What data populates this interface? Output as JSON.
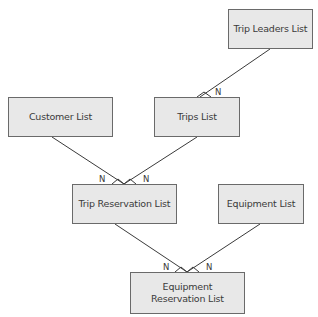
{
  "diagram": {
    "type": "entity-relationship",
    "nodes": [
      {
        "id": "trip_leaders",
        "label": "Trip Leaders List",
        "x": 228,
        "y": 9,
        "w": 85,
        "h": 40
      },
      {
        "id": "customer",
        "label": "Customer List",
        "x": 8,
        "y": 97,
        "w": 105,
        "h": 40
      },
      {
        "id": "trips",
        "label": "Trips List",
        "x": 154,
        "y": 97,
        "w": 86,
        "h": 40
      },
      {
        "id": "trip_reservation",
        "label": "Trip Reservation List",
        "x": 72,
        "y": 184,
        "w": 105,
        "h": 40
      },
      {
        "id": "equipment",
        "label": "Equipment List",
        "x": 218,
        "y": 184,
        "w": 86,
        "h": 40
      },
      {
        "id": "equipment_reservation",
        "label": "Equipment\nReservation List",
        "x": 130,
        "y": 272,
        "w": 115,
        "h": 42
      }
    ],
    "edges": [
      {
        "from": "trip_leaders",
        "to": "trips",
        "from_card": "1",
        "to_card": "N"
      },
      {
        "from": "customer",
        "to": "trip_reservation",
        "from_card": "1",
        "to_card": "N"
      },
      {
        "from": "trips",
        "to": "trip_reservation",
        "from_card": "1",
        "to_card": "N"
      },
      {
        "from": "trip_reservation",
        "to": "equipment_reservation",
        "from_card": "1",
        "to_card": "N"
      },
      {
        "from": "equipment",
        "to": "equipment_reservation",
        "from_card": "1",
        "to_card": "N"
      }
    ],
    "cardinality_labels": [
      "N",
      "N",
      "N",
      "N",
      "N"
    ],
    "colors": {
      "box_fill": "#e8e8e8",
      "box_border": "#6a6a6a",
      "line": "#3a3a3a",
      "text": "#3a3a3a"
    }
  }
}
